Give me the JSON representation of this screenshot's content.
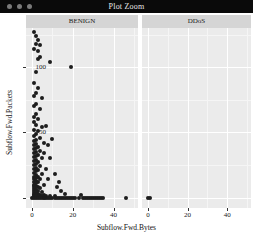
{
  "window": {
    "title": "Plot Zoom",
    "controls": [
      {
        "name": "window-button-close",
        "color": "#7a7a7a"
      },
      {
        "name": "window-button-minimize",
        "color": "#7a7a7a"
      },
      {
        "name": "window-button-maximize",
        "color": "#7a7a7a"
      }
    ],
    "titlebar_color": "#0a0a0a"
  },
  "chart_data": {
    "type": "scatter",
    "title": "",
    "xlabel": "Subflow.Fwd.Bytes",
    "ylabel": "Subflow.Fwd.Packets",
    "xlim": [
      -3,
      52
    ],
    "ylim": [
      -8,
      130
    ],
    "xticks": [
      0,
      20,
      40
    ],
    "yticks": [
      0,
      50,
      100
    ],
    "grid": true,
    "panel_background": "#ebebeb",
    "grid_major_color": "#ffffff",
    "point_color": "#1d1d1d",
    "facet_variable": "Label",
    "facets": [
      {
        "label": "BENIGN",
        "points": [
          [
            1,
            127
          ],
          [
            2,
            124
          ],
          [
            3,
            121
          ],
          [
            2,
            118
          ],
          [
            4,
            117
          ],
          [
            1,
            114
          ],
          [
            3,
            112
          ],
          [
            9,
            104
          ],
          [
            19,
            100
          ],
          [
            2,
            96
          ],
          [
            1,
            88
          ],
          [
            3,
            84
          ],
          [
            2,
            80
          ],
          [
            1,
            78
          ],
          [
            5,
            76
          ],
          [
            2,
            72
          ],
          [
            1,
            70
          ],
          [
            4,
            68
          ],
          [
            2,
            64
          ],
          [
            1,
            62
          ],
          [
            3,
            60
          ],
          [
            1,
            58
          ],
          [
            2,
            56
          ],
          [
            5,
            54
          ],
          [
            1,
            52
          ],
          [
            3,
            51
          ],
          [
            2,
            49
          ],
          [
            1,
            47
          ],
          [
            4,
            46
          ],
          [
            2,
            44
          ],
          [
            1,
            43
          ],
          [
            6,
            42
          ],
          [
            2,
            41
          ],
          [
            1,
            40
          ],
          [
            3,
            39
          ],
          [
            2,
            38
          ],
          [
            1,
            37
          ],
          [
            4,
            36
          ],
          [
            2,
            35
          ],
          [
            1,
            34
          ],
          [
            3,
            33
          ],
          [
            2,
            32
          ],
          [
            1,
            31
          ],
          [
            5,
            30
          ],
          [
            2,
            29
          ],
          [
            1,
            28
          ],
          [
            3,
            27
          ],
          [
            2,
            26
          ],
          [
            1,
            25
          ],
          [
            4,
            24
          ],
          [
            2,
            23
          ],
          [
            1,
            22
          ],
          [
            3,
            21
          ],
          [
            2,
            20
          ],
          [
            1,
            19
          ],
          [
            5,
            18
          ],
          [
            2,
            17
          ],
          [
            1,
            16
          ],
          [
            3,
            16
          ],
          [
            2,
            15
          ],
          [
            1,
            14
          ],
          [
            4,
            14
          ],
          [
            2,
            13
          ],
          [
            1,
            12
          ],
          [
            3,
            12
          ],
          [
            2,
            11
          ],
          [
            1,
            10
          ],
          [
            6,
            10
          ],
          [
            2,
            9
          ],
          [
            1,
            9
          ],
          [
            3,
            8
          ],
          [
            2,
            8
          ],
          [
            1,
            7
          ],
          [
            4,
            7
          ],
          [
            2,
            6
          ],
          [
            1,
            6
          ],
          [
            3,
            5
          ],
          [
            2,
            5
          ],
          [
            1,
            4
          ],
          [
            5,
            4
          ],
          [
            2,
            4
          ],
          [
            1,
            3
          ],
          [
            3,
            3
          ],
          [
            2,
            3
          ],
          [
            1,
            2
          ],
          [
            4,
            2
          ],
          [
            2,
            2
          ],
          [
            6,
            2
          ],
          [
            1,
            1
          ],
          [
            3,
            1
          ],
          [
            2,
            1
          ],
          [
            5,
            1
          ],
          [
            7,
            1
          ],
          [
            9,
            1
          ],
          [
            11,
            1
          ],
          [
            0,
            0
          ],
          [
            1,
            0
          ],
          [
            2,
            0
          ],
          [
            3,
            0
          ],
          [
            4,
            0
          ],
          [
            5,
            0
          ],
          [
            6,
            0
          ],
          [
            7,
            0
          ],
          [
            8,
            0
          ],
          [
            9,
            0
          ],
          [
            10,
            0
          ],
          [
            11,
            0
          ],
          [
            12,
            0
          ],
          [
            13,
            0
          ],
          [
            14,
            0
          ],
          [
            15,
            0
          ],
          [
            16,
            0
          ],
          [
            17,
            0
          ],
          [
            18,
            0
          ],
          [
            19,
            0
          ],
          [
            20,
            0
          ],
          [
            21,
            0
          ],
          [
            23,
            0
          ],
          [
            25,
            0
          ],
          [
            26,
            0
          ],
          [
            27,
            0
          ],
          [
            28,
            0
          ],
          [
            29,
            0
          ],
          [
            30,
            0
          ],
          [
            31,
            0
          ],
          [
            32,
            0
          ],
          [
            33,
            0
          ],
          [
            34,
            0
          ],
          [
            35,
            0
          ],
          [
            24,
            2
          ],
          [
            8,
            14
          ],
          [
            7,
            22
          ],
          [
            9,
            30
          ],
          [
            6,
            34
          ],
          [
            8,
            40
          ],
          [
            10,
            45
          ],
          [
            7,
            55
          ],
          [
            12,
            8
          ],
          [
            14,
            5
          ],
          [
            16,
            3
          ],
          [
            13,
            12
          ],
          [
            11,
            18
          ],
          [
            4,
            108
          ],
          [
            3,
            106
          ]
        ]
      },
      {
        "label": "DDoS",
        "points": [
          [
            0,
            0
          ]
        ]
      }
    ],
    "extra_points_panel_left": [
      [
        46,
        0
      ]
    ],
    "extra_points_panel_right": [
      [
        1,
        0
      ]
    ]
  }
}
